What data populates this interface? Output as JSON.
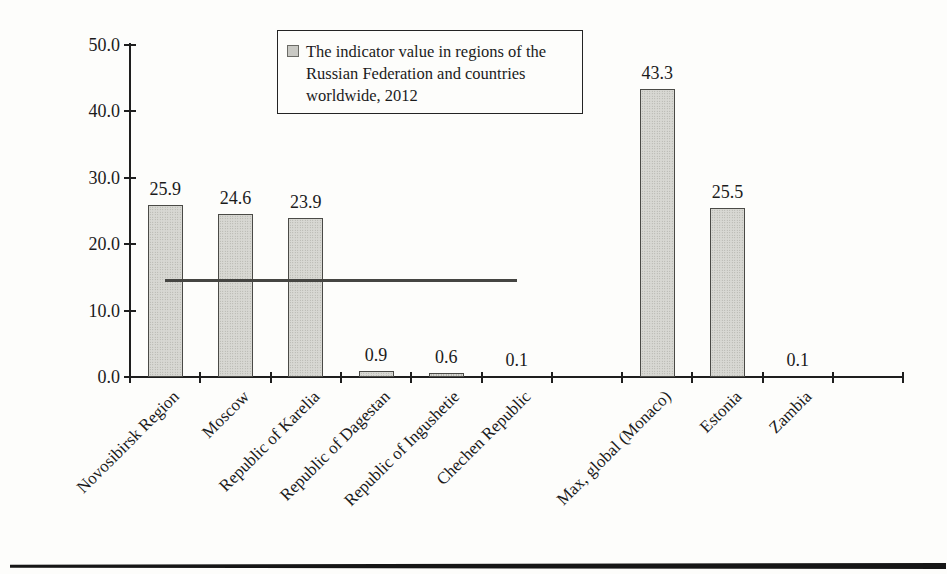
{
  "chart_data": {
    "type": "bar",
    "title": "",
    "xlabel": "",
    "ylabel": "",
    "categories": [
      "Novosibirsk Region",
      "Moscow",
      "Republic of Karelia",
      "Republic of Dagestan",
      "Republic of Ingushetie",
      "Chechen Republic",
      "",
      "Max, global (Monaco)",
      "Estonia",
      "Zambia",
      ""
    ],
    "values": [
      25.9,
      24.6,
      23.9,
      0.9,
      0.6,
      0.1,
      null,
      43.3,
      25.5,
      0.1,
      null
    ],
    "value_labels": [
      "25.9",
      "24.6",
      "23.9",
      "0.9",
      "0.6",
      "0.1",
      "",
      "43.3",
      "25.5",
      "0.1",
      ""
    ],
    "ylim": [
      0,
      50
    ],
    "ytick_interval": 10,
    "ytick_labels": [
      "0.0",
      "10.0",
      "20.0",
      "30.0",
      "40.0",
      "50.0"
    ],
    "grid": false,
    "legend": {
      "position": "top-center",
      "label": "The indicator value in regions of the Russian Federation and countries worldwide, 2012",
      "label_lines": [
        "The indicator value in regions of the",
        "Russian Federation and countries",
        "worldwide, 2012"
      ]
    },
    "reference_line": {
      "value": 14.6,
      "from_category": 0,
      "to_category": 5
    },
    "colors": {
      "bar_fill": "#d8d8d3",
      "bar_border": "#4a4a46",
      "axis": "#1e1e1e",
      "reference_line": "#454542",
      "legend_marker": "#c9c9c4"
    }
  }
}
